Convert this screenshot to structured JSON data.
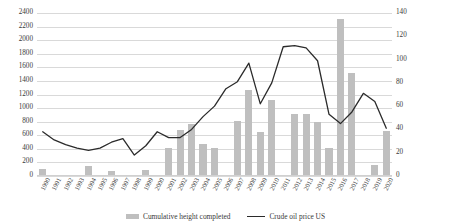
{
  "chart_data": {
    "type": "bar",
    "title": "",
    "xlabel": "",
    "ylabel": "",
    "grid": true,
    "legend_position": "bottom",
    "categories": [
      "1990",
      "1991",
      "1992",
      "1993",
      "1994",
      "1995",
      "1996",
      "1997",
      "1998",
      "1999",
      "2000",
      "2001",
      "2002",
      "2003",
      "2004",
      "2005",
      "2006",
      "2007",
      "2008",
      "2009",
      "2010",
      "2011",
      "2012",
      "2013",
      "2014",
      "2015",
      "2016",
      "2017",
      "2018",
      "2019",
      "2020"
    ],
    "series": [
      {
        "name": "Cumulative height completed",
        "type": "bar",
        "axis": "left",
        "color": "#bfbfbf",
        "values": [
          90,
          0,
          0,
          0,
          130,
          0,
          60,
          0,
          0,
          70,
          0,
          400,
          670,
          750,
          450,
          400,
          0,
          800,
          1250,
          630,
          1100,
          0,
          900,
          900,
          780,
          400,
          2300,
          1500,
          0,
          150,
          650
        ]
      },
      {
        "name": "Crude oil price US",
        "type": "line",
        "axis": "right",
        "color": "#2b2b2b",
        "values": [
          38,
          31,
          27,
          24,
          22,
          24,
          29,
          32,
          18,
          26,
          38,
          33,
          33,
          40,
          51,
          60,
          75,
          81,
          97,
          62,
          80,
          111,
          112,
          110,
          99,
          53,
          45,
          55,
          71,
          64,
          41
        ]
      }
    ],
    "left_axis": {
      "min": 0,
      "max": 2400,
      "step": 200,
      "ticks": [
        "0",
        "200",
        "400",
        "600",
        "800",
        "1000",
        "1200",
        "1400",
        "1600",
        "1800",
        "2000",
        "2200",
        "2400"
      ]
    },
    "right_axis": {
      "min": 0,
      "max": 140,
      "step": 20,
      "ticks": [
        "0",
        "20",
        "40",
        "60",
        "80",
        "100",
        "120",
        "140"
      ]
    }
  },
  "legend": {
    "items": [
      {
        "label": "Cumulative height completed",
        "marker": "bar-swatch"
      },
      {
        "label": "Crude oil price US",
        "marker": "line-swatch"
      }
    ]
  }
}
